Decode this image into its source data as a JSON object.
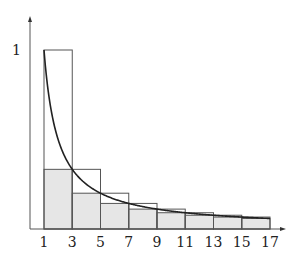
{
  "chart_data": {
    "type": "bar",
    "title": "",
    "xlabel": "",
    "ylabel": "",
    "x_ticks": [
      "1",
      "3",
      "5",
      "7",
      "9",
      "11",
      "13",
      "15",
      "17"
    ],
    "y_ticks": [
      "1"
    ],
    "xlim": [
      1,
      17
    ],
    "ylim": [
      0,
      1
    ],
    "curve": {
      "name": "f(x) = 1/x",
      "x_range": [
        1,
        17
      ]
    },
    "series": [
      {
        "name": "upper boxes (left endpoint 1/x, width 2)",
        "style": "outline",
        "x_left": [
          1,
          3,
          5,
          7,
          9,
          11,
          13,
          15
        ],
        "values": [
          1,
          0.3333,
          0.2,
          0.1429,
          0.1111,
          0.0909,
          0.0769,
          0.0667
        ]
      },
      {
        "name": "lower boxes (right endpoint 1/(x+2), width 2)",
        "style": "shaded",
        "x_left": [
          1,
          3,
          5,
          7,
          9,
          11,
          13,
          15
        ],
        "values": [
          0.3333,
          0.2,
          0.1429,
          0.1111,
          0.0909,
          0.0769,
          0.0667,
          0.0588
        ]
      }
    ],
    "grid": false,
    "legend": "none"
  },
  "labels": {
    "y_one": "1"
  }
}
